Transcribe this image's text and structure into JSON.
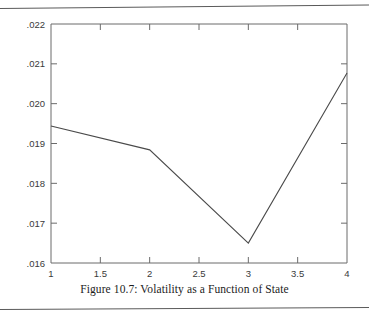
{
  "figure": {
    "caption": "Figure 10.7:  Volatility as a Function of State"
  },
  "chart_data": {
    "type": "line",
    "title": "",
    "xlabel": "",
    "ylabel": "",
    "x": [
      1,
      2,
      3,
      4
    ],
    "values": [
      0.01944,
      0.01884,
      0.0165,
      0.02077
    ],
    "series": [
      {
        "name": "Volatility",
        "x": [
          1,
          2,
          3,
          4
        ],
        "values": [
          0.01944,
          0.01884,
          0.0165,
          0.02077
        ]
      }
    ],
    "xlim": [
      1,
      4
    ],
    "ylim": [
      0.016,
      0.022
    ],
    "xticks": [
      1,
      1.5,
      2,
      2.5,
      3,
      3.5,
      4
    ],
    "xtick_labels": [
      "1",
      "1.5",
      "2",
      "2.5",
      "3",
      "3.5",
      "4"
    ],
    "yticks": [
      0.016,
      0.017,
      0.018,
      0.019,
      0.02,
      0.021,
      0.022
    ],
    "ytick_labels": [
      ".016",
      ".017",
      ".018",
      ".019",
      ".020",
      ".021",
      ".022"
    ],
    "grid": false,
    "legend": null,
    "line_color": "#4a4a4a",
    "axis_color": "#6b6b6b"
  }
}
